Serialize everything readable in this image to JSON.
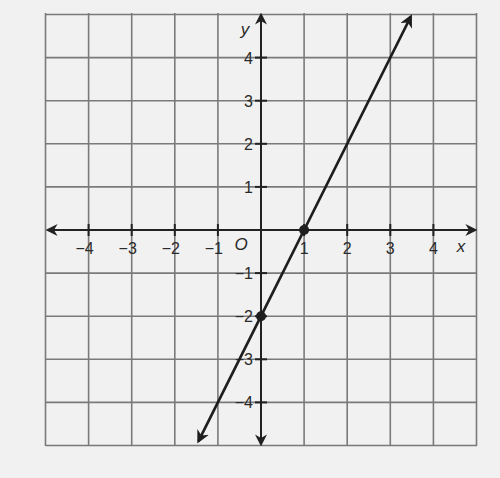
{
  "chart_data": {
    "type": "line",
    "title": "",
    "xlabel": "x",
    "ylabel": "y",
    "origin_label": "O",
    "xlim": [
      -5,
      5
    ],
    "ylim": [
      -5,
      5
    ],
    "grid": true,
    "x_ticks": [
      -4,
      -3,
      -2,
      -1,
      1,
      2,
      3,
      4
    ],
    "y_ticks": [
      4,
      3,
      2,
      1,
      -1,
      -2,
      -3,
      -4
    ],
    "x_tick_labels": [
      "−4",
      "−3",
      "−2",
      "−1",
      "1",
      "2",
      "3",
      "4"
    ],
    "y_tick_labels": [
      "4",
      "3",
      "2",
      "1",
      "−1",
      "−2",
      "−3",
      "−4"
    ],
    "series": [
      {
        "name": "line",
        "equation": "y = 2x - 2",
        "slope": 2,
        "y_intercept": -2,
        "x_intercept": 1,
        "extends": "both directions (arrows)",
        "x": [
          -1.5,
          3.5
        ],
        "y": [
          -5,
          5
        ]
      }
    ],
    "marked_points": [
      {
        "x": 1,
        "y": 0
      },
      {
        "x": 0,
        "y": -2
      }
    ],
    "colors": {
      "background": "#f1f1f1",
      "grid": "#7a7a7a",
      "axis": "#222222",
      "line": "#1e1e1e"
    }
  }
}
